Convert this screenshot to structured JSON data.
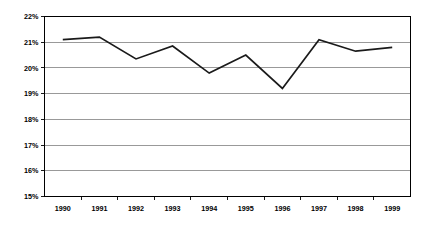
{
  "chart_data": {
    "type": "line",
    "title": "",
    "subtitle": "",
    "xlabel": "",
    "ylabel": "",
    "categories": [
      "1990",
      "1991",
      "1992",
      "1993",
      "1994",
      "1995",
      "1996",
      "1997",
      "1998",
      "1999"
    ],
    "series": [
      {
        "name": "",
        "values": [
          21.1,
          21.2,
          20.35,
          20.85,
          19.8,
          20.5,
          19.2,
          21.1,
          20.65,
          20.8
        ],
        "color": "#1a1a1a"
      }
    ],
    "ylim": [
      15,
      22
    ],
    "ytick_values": [
      15,
      16,
      17,
      18,
      19,
      20,
      21,
      22
    ],
    "ytick_labels": [
      "15%",
      "16%",
      "17%",
      "18%",
      "19%",
      "20%",
      "21%",
      "22%"
    ],
    "xtick_labels": [
      "1990",
      "1991",
      "1992",
      "1993",
      "1994",
      "1995",
      "1996",
      "1997",
      "1998",
      "1999"
    ],
    "grid": true,
    "grid_axis": "y",
    "legend": false,
    "legend_position": "none",
    "value_suffix": "%",
    "colors": {
      "line": "#1a1a1a",
      "grid": "#808080",
      "axis": "#000000",
      "background": "#ffffff",
      "text": "#000000"
    }
  }
}
